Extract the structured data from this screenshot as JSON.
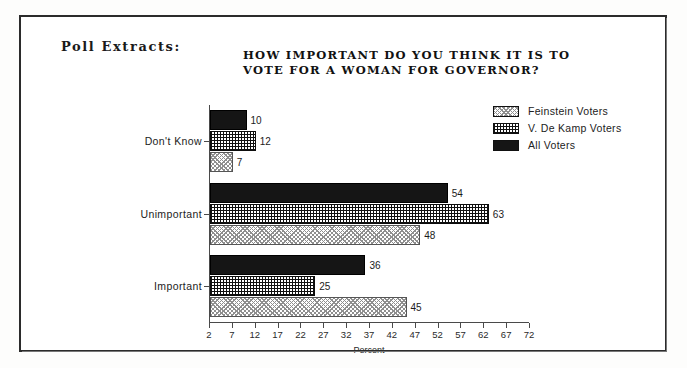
{
  "header": {
    "label": "Poll Extracts:"
  },
  "chart_data": {
    "type": "bar",
    "orientation": "horizontal",
    "title": "HOW IMPORTANT DO YOU THINK IT IS TO VOTE FOR A WOMAN FOR GOVERNOR?",
    "title_lines": [
      "HOW IMPORTANT DO YOU THINK IT IS TO",
      "VOTE FOR A WOMAN FOR GOVERNOR?"
    ],
    "categories": [
      "Important",
      "Unimportant",
      "Don't Know"
    ],
    "series": [
      {
        "name": "Feinstein Voters",
        "pattern": "stipple",
        "values": [
          45,
          48,
          7
        ]
      },
      {
        "name": "V. De Kamp Voters",
        "pattern": "crosshatch",
        "values": [
          25,
          63,
          12
        ]
      },
      {
        "name": "All Voters",
        "pattern": "solid",
        "values": [
          36,
          54,
          10
        ]
      }
    ],
    "xlabel": "Percent",
    "ylabel": "",
    "xlim": [
      2,
      72
    ],
    "xticks": [
      2,
      7,
      12,
      17,
      22,
      27,
      32,
      37,
      42,
      47,
      52,
      57,
      62,
      67,
      72
    ],
    "xtick_labels": [
      "2",
      "7",
      "12",
      "17",
      "22",
      "27",
      "32",
      "37",
      "42",
      "47",
      "52",
      "57",
      "62",
      "67",
      "72"
    ],
    "grid": false,
    "legend_position": "top-right",
    "value_labels": true
  },
  "legend": {
    "items": [
      {
        "label": "Feinstein Voters"
      },
      {
        "label": "V. De Kamp Voters"
      },
      {
        "label": "All Voters"
      }
    ]
  }
}
